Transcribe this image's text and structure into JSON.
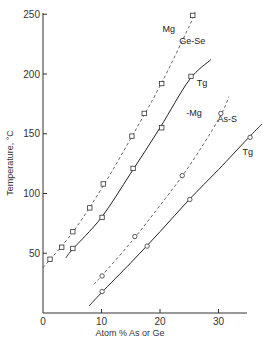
{
  "chart_data": {
    "type": "line",
    "title": "",
    "xlabel": "Atom % As or Ge",
    "ylabel": "Temperature, °C",
    "xlim": [
      0,
      35
    ],
    "ylim": [
      0,
      250
    ],
    "xticks": [
      0,
      10,
      20,
      30
    ],
    "yticks": [
      50,
      100,
      150,
      200,
      250
    ],
    "grid": false,
    "legend": "none (inline annotations)",
    "annotations": [
      {
        "text": "Mg",
        "x": 21.5,
        "y": 235
      },
      {
        "text": "Ge-Se",
        "x": 25.5,
        "y": 225
      },
      {
        "text": "Tg",
        "x": 27.2,
        "y": 190
      },
      {
        "text": "-Mg",
        "x": 25.8,
        "y": 165
      },
      {
        "text": "As-S",
        "x": 31.5,
        "y": 160
      },
      {
        "text": "Tg",
        "x": 35.0,
        "y": 132
      }
    ],
    "series": [
      {
        "name": "Ge-Se Mg",
        "style": "dashed",
        "marker": "square",
        "points": [
          [
            1.2,
            45
          ],
          [
            3.2,
            55
          ],
          [
            5.1,
            68
          ],
          [
            8.0,
            88
          ],
          [
            10.3,
            108
          ],
          [
            15.2,
            148
          ],
          [
            17.3,
            167
          ],
          [
            20.3,
            192
          ],
          [
            25.6,
            249
          ]
        ],
        "curve": [
          [
            0,
            38
          ],
          [
            5,
            67
          ],
          [
            10,
            104
          ],
          [
            15,
            146
          ],
          [
            20,
            190
          ],
          [
            25,
            240
          ],
          [
            26,
            252
          ]
        ]
      },
      {
        "name": "Ge-Se Tg",
        "style": "solid",
        "marker": "square",
        "points": [
          [
            5.1,
            54
          ],
          [
            10.1,
            80
          ],
          [
            15.4,
            121
          ],
          [
            20.3,
            155
          ],
          [
            25.3,
            198
          ]
        ],
        "curve": [
          [
            3.9,
            46
          ],
          [
            5,
            53
          ],
          [
            10,
            80
          ],
          [
            15,
            117
          ],
          [
            20,
            155
          ],
          [
            25,
            195
          ],
          [
            28.7,
            212
          ]
        ]
      },
      {
        "name": "As-S Mg",
        "style": "dashed",
        "marker": "circle",
        "points": [
          [
            10.1,
            31
          ],
          [
            15.7,
            64
          ],
          [
            23.8,
            115
          ],
          [
            30.4,
            167
          ]
        ],
        "curve": [
          [
            8.7,
            24
          ],
          [
            10,
            31
          ],
          [
            15,
            59
          ],
          [
            20,
            90
          ],
          [
            25,
            123
          ],
          [
            30,
            162
          ],
          [
            31.8,
            181
          ]
        ]
      },
      {
        "name": "As-S Tg",
        "style": "solid",
        "marker": "circle",
        "points": [
          [
            10.1,
            18
          ],
          [
            17.8,
            56
          ],
          [
            25.1,
            95
          ],
          [
            35.4,
            147
          ]
        ],
        "curve": [
          [
            7.9,
            6
          ],
          [
            10,
            17
          ],
          [
            15,
            42
          ],
          [
            20,
            68
          ],
          [
            25,
            95
          ],
          [
            30,
            120
          ],
          [
            35,
            146
          ],
          [
            37.4,
            158
          ]
        ]
      }
    ]
  }
}
